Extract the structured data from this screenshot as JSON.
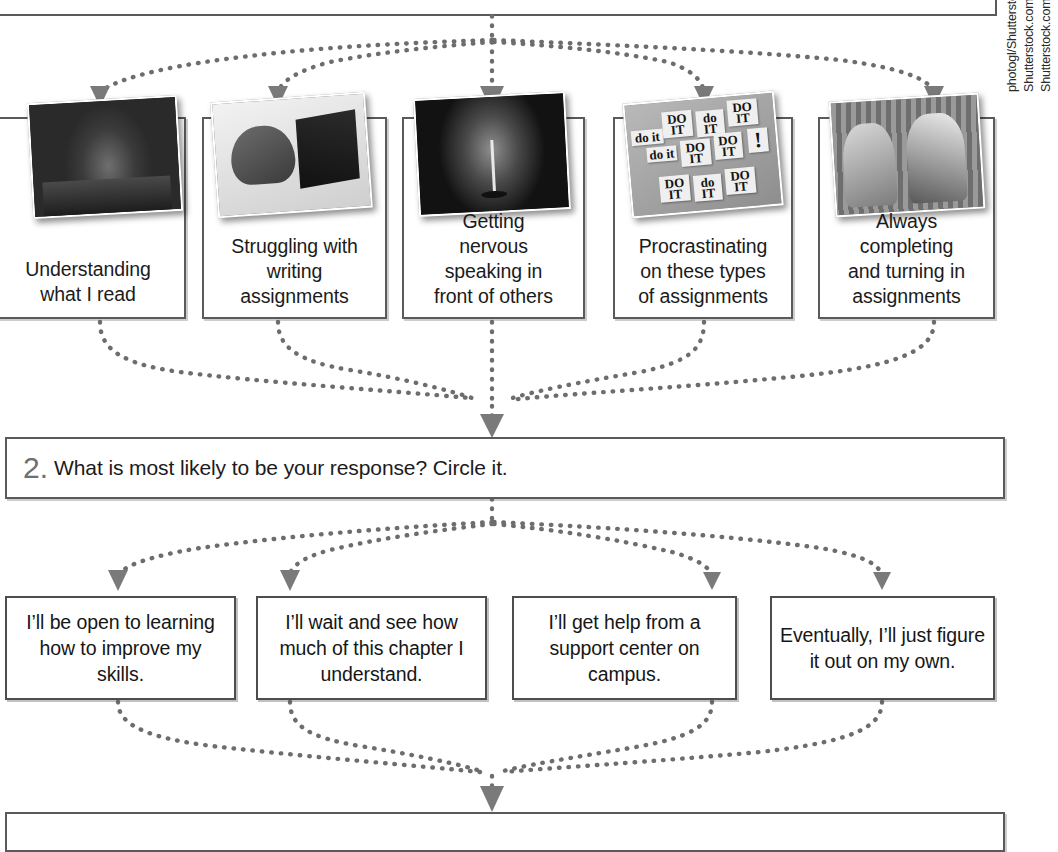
{
  "page": {
    "background_color": "#ffffff",
    "box_border_color": "#5a5a5a",
    "connector_color": "#6d6d6d"
  },
  "top_prompt_box": {
    "note": "partially visible question box cropped at top of page",
    "text": ""
  },
  "options": {
    "items": [
      {
        "caption": "Understanding\nwhat I read",
        "caption_lines": [
          "Understanding",
          "what I read"
        ],
        "photo_name": "student-in-library-photo"
      },
      {
        "caption": "Struggling with\nwriting\nassignments",
        "caption_lines": [
          "Struggling with",
          "writing",
          "assignments"
        ],
        "photo_name": "student-at-laptop-photo"
      },
      {
        "caption": "Getting\nnervous\nspeaking in\nfront of others",
        "caption_lines": [
          "Getting",
          "nervous",
          "speaking in",
          "front of others"
        ],
        "photo_name": "microphone-on-stage-photo"
      },
      {
        "caption": "Procrastinating\non these types\nof assignments",
        "caption_lines": [
          "Procrastinating",
          "on these types",
          "of assignments"
        ],
        "photo_name": "do-it-sticky-notes-photo"
      },
      {
        "caption": "Always\ncompleting\nand turning in\nassignments",
        "caption_lines": [
          "Always",
          "completing",
          "and turning in",
          "assignments"
        ],
        "photo_name": "two-students-at-desk-photo"
      }
    ],
    "sticky_notes": [
      "do it",
      "DO IT",
      "do IT",
      "DO IT",
      "do it",
      "DO IT",
      "DO IT",
      "!",
      "DO IT",
      "do IT",
      "DO IT"
    ]
  },
  "question_2": {
    "number": "2.",
    "text": "What is most likely to be your response? Circle it."
  },
  "responses": {
    "items": [
      {
        "text": "I’ll be open to learning how to improve my skills.",
        "lines": [
          "I’ll be open to",
          "learning how to",
          "improve my skills."
        ]
      },
      {
        "text": "I’ll wait and see how much of this chapter I understand.",
        "lines": [
          "I’ll wait and see",
          "how much of this",
          "chapter I understand."
        ]
      },
      {
        "text": "I’ll get help from a support center on campus.",
        "lines": [
          "I’ll get help from a",
          "support center on",
          "campus."
        ]
      },
      {
        "text": "Eventually, I’ll just figure it out on my own.",
        "lines": [
          "Eventually, I’ll just",
          "figure it out on my",
          "own."
        ]
      }
    ]
  },
  "bottom_question_box": {
    "note": "next question box, cropped at bottom of page",
    "text": ""
  },
  "photo_credit": {
    "lines": [
      "photogl/Shutterstock.com; leolintang/",
      "Shutterstock.com; Sarah Holmlund/",
      "Shutterstock.com; marekuliasz/Shutterstock."
    ]
  }
}
